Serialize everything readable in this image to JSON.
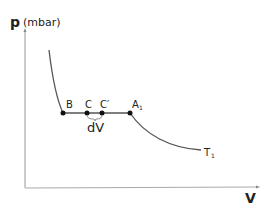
{
  "diagram": {
    "type": "pV isotherm with phase transition",
    "y_axis": {
      "symbol": "p",
      "unit": "(mbar)"
    },
    "x_axis": {
      "symbol": "V"
    },
    "points": [
      {
        "label": "B",
        "x": 63,
        "y": 113
      },
      {
        "label": "C",
        "x": 87,
        "y": 113
      },
      {
        "label": "C′",
        "x": 102,
        "y": 113
      },
      {
        "label": "A",
        "sub": "1",
        "x": 130,
        "y": 113
      }
    ],
    "brace_label": "dV",
    "curve_label": {
      "main": "T",
      "sub": "1"
    },
    "colors": {
      "line": "#555555",
      "axis": "#aaaaaa",
      "point": "#111111",
      "text": "#222222"
    }
  }
}
